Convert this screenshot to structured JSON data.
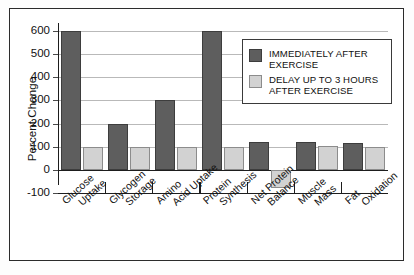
{
  "chart_data": {
    "type": "bar",
    "title": "",
    "xlabel": "",
    "ylabel": "Percent Change",
    "ylim": [
      -100,
      600
    ],
    "yticks": [
      600,
      500,
      400,
      300,
      200,
      100,
      0,
      -100
    ],
    "ytick_labels": [
      "600",
      "500",
      "400",
      "300",
      "200",
      "100",
      "0",
      "-100"
    ],
    "grid": true,
    "legend_position": "upper right (inside plot)",
    "categories": [
      "Glucose Uptake",
      "Glycogen Storage",
      "Amino Acid Uptake",
      "Protein Synthesis",
      "Net Protein Balance",
      "Muscle Mass",
      "Fat Oxidation"
    ],
    "category_lines": [
      [
        "Glucose",
        "Uptake"
      ],
      [
        "Glycogen",
        "Storage"
      ],
      [
        "Amino",
        "Acid Uptake"
      ],
      [
        "Protein",
        "Synthesis"
      ],
      [
        "Net Protein",
        "Balance"
      ],
      [
        "Muscle",
        "Mass"
      ],
      [
        "Fat",
        "Oxidation"
      ]
    ],
    "series": [
      {
        "name": "IMMEDIATELY AFTER EXERCISE",
        "color": "#5e5e5e",
        "values": [
          600,
          200,
          300,
          600,
          120,
          120,
          115
        ]
      },
      {
        "name": "DELAY UP TO 3 HOURS AFTER EXERCISE",
        "color": "#d2d2d2",
        "values": [
          100,
          100,
          100,
          100,
          -80,
          105,
          100
        ]
      }
    ]
  },
  "legend": {
    "entries": [
      {
        "label": "IMMEDIATELY AFTER EXERCISE"
      },
      {
        "label": "DELAY UP TO 3 HOURS AFTER EXERCISE"
      }
    ]
  },
  "axis": {
    "y_title": "Percent Change"
  }
}
